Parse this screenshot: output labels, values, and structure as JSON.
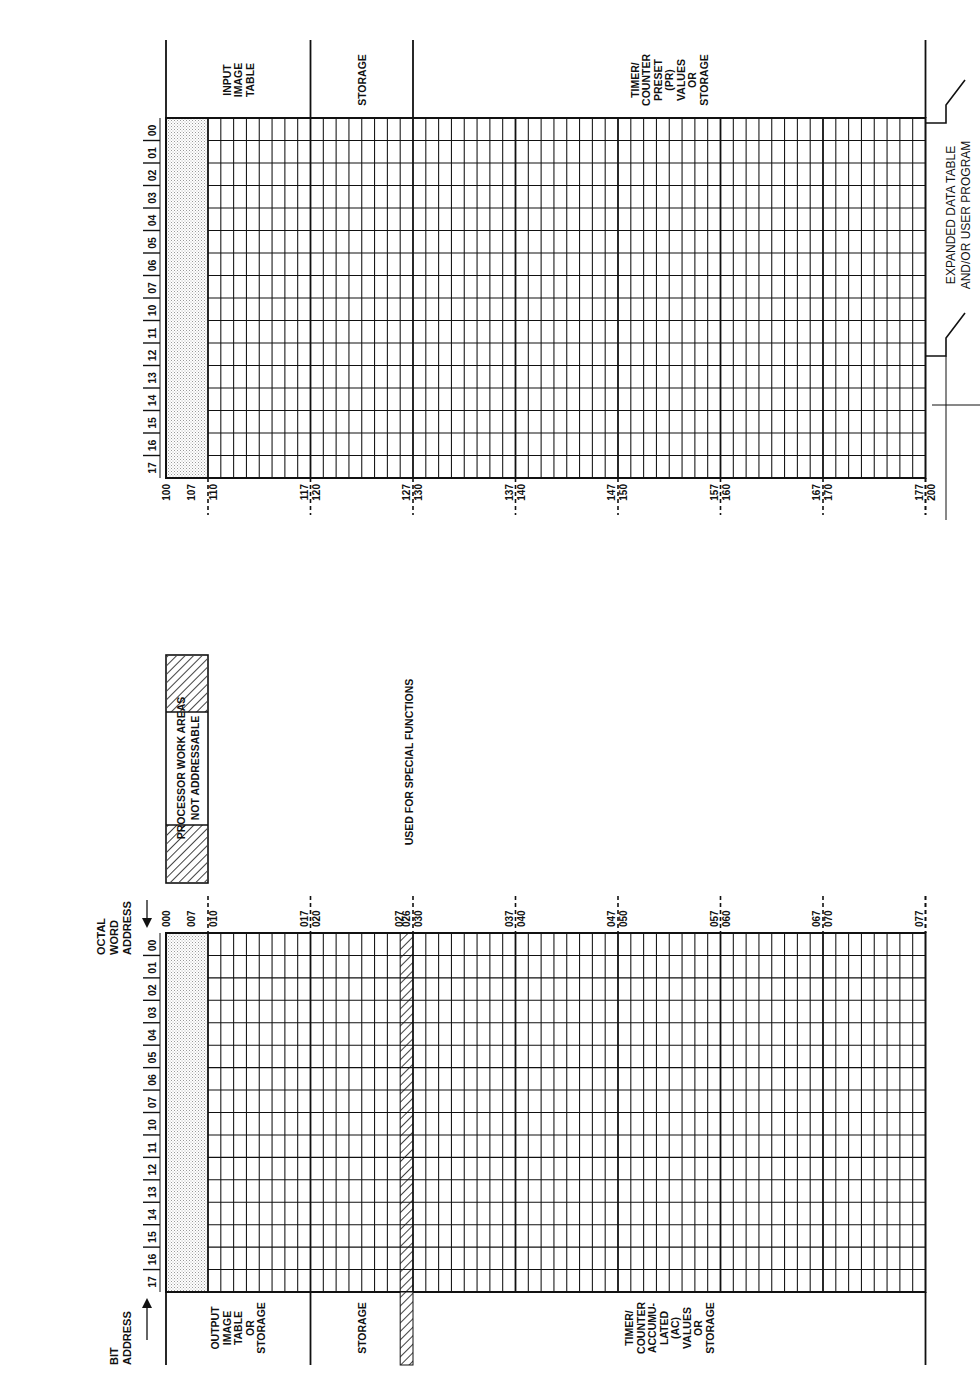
{
  "axis_labels": {
    "bit_address": [
      "BIT",
      "ADDRESS"
    ],
    "octal_word_address": [
      "OCTAL",
      "WORD",
      "ADDRESS"
    ]
  },
  "bit_numbers": [
    "17",
    "16",
    "15",
    "14",
    "13",
    "12",
    "11",
    "10",
    "07",
    "06",
    "05",
    "04",
    "03",
    "02",
    "01",
    "00"
  ],
  "lower_table": {
    "name": "Words 000-077",
    "start_address": "000",
    "reserved_label": "007",
    "addresses": [
      {
        "end": "",
        "start": "010"
      },
      {
        "end": "017",
        "start": "020"
      },
      {
        "end": "026",
        "mid": "027",
        "start": "030"
      },
      {
        "end": "037",
        "start": "040"
      },
      {
        "end": "047",
        "start": "050"
      },
      {
        "end": "057",
        "start": "060"
      },
      {
        "end": "067",
        "start": "070"
      },
      {
        "end": "077",
        "start": ""
      }
    ],
    "regions": [
      {
        "label": [
          "OUTPUT",
          "IMAGE",
          "TABLE",
          "OR",
          "STORAGE"
        ]
      },
      {
        "label": [
          "STORAGE"
        ]
      },
      {
        "label": [
          "TIMER/",
          "COUNTER",
          "ACCUMU-",
          "LATED",
          "(AC)",
          "VALUES",
          "OR",
          "STORAGE"
        ]
      }
    ],
    "special_note": "USED FOR SPECIAL FUNCTIONS"
  },
  "processor_box": {
    "lines": [
      "PROCESSOR WORK AREAS",
      "NOT ADDRESSABLE"
    ]
  },
  "upper_table": {
    "name": "Words 100-177",
    "start_address": "100",
    "reserved_label": "107",
    "addresses": [
      {
        "end": "",
        "start": "110"
      },
      {
        "end": "117",
        "start": "120"
      },
      {
        "end": "127",
        "start": "130"
      },
      {
        "end": "137",
        "start": "140"
      },
      {
        "end": "147",
        "start": "150"
      },
      {
        "end": "157",
        "start": "160"
      },
      {
        "end": "167",
        "start": "170"
      },
      {
        "end": "177",
        "start": "200"
      }
    ],
    "regions": [
      {
        "label": [
          "INPUT",
          "IMAGE",
          "TABLE"
        ]
      },
      {
        "label": [
          "STORAGE"
        ]
      },
      {
        "label": [
          "TIMER/",
          "COUNTER",
          "PRESET",
          "(PR)",
          "VALUES",
          "OR",
          "STORAGE"
        ]
      }
    ],
    "expansion_note": [
      "EXPANDED DATA TABLE",
      "AND/OR USER PROGRAM"
    ]
  },
  "colors": {
    "ink": "#111111",
    "reserved_fill": "#d9d9d9",
    "background": "#ffffff"
  }
}
